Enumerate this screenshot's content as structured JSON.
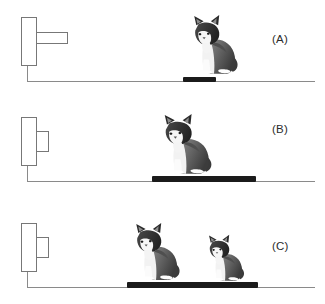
{
  "figure": {
    "background_color": "#ffffff",
    "line_color": "#8a8a8a",
    "outline_color": "#777777",
    "platform_color": "#1b1b1b",
    "label_color": "#2b2b2b"
  },
  "panels": [
    {
      "id": "A",
      "label": "(A)",
      "mechanism": {
        "wall_block": {
          "x": 21,
          "y": 17,
          "width": 16,
          "height": 49
        },
        "rod": {
          "x": 36,
          "y": 32,
          "width": 32,
          "height": 12
        },
        "rod_description": "long extended rod"
      },
      "ground": {
        "x": 27,
        "y": 81,
        "width": 288
      },
      "ground_riser": {
        "x": 27,
        "y": 66,
        "height": 16
      },
      "platform": {
        "x": 183,
        "y": 77,
        "width": 33,
        "height": 5
      },
      "cats": [
        {
          "x": 188,
          "y": 14,
          "width": 52,
          "height": 64,
          "size": "large",
          "facing": "left"
        }
      ],
      "label_pos": {
        "x": 272,
        "y": 33
      }
    },
    {
      "id": "B",
      "label": "(B)",
      "mechanism": {
        "wall_block": {
          "x": 21,
          "y": 117,
          "width": 16,
          "height": 49
        },
        "rod": {
          "x": 36,
          "y": 131,
          "width": 13,
          "height": 21
        },
        "rod_description": "short compressed rod"
      },
      "ground": {
        "x": 27,
        "y": 181,
        "width": 288
      },
      "ground_riser": {
        "x": 27,
        "y": 166,
        "height": 16
      },
      "platform": {
        "x": 152,
        "y": 176,
        "width": 104,
        "height": 6
      },
      "cats": [
        {
          "x": 158,
          "y": 113,
          "width": 56,
          "height": 65,
          "size": "large",
          "facing": "left"
        }
      ],
      "label_pos": {
        "x": 272,
        "y": 123
      }
    },
    {
      "id": "C",
      "label": "(C)",
      "mechanism": {
        "wall_block": {
          "x": 21,
          "y": 223,
          "width": 16,
          "height": 49
        },
        "rod": {
          "x": 36,
          "y": 237,
          "width": 13,
          "height": 21
        },
        "rod_description": "short compressed rod"
      },
      "ground": {
        "x": 27,
        "y": 287,
        "width": 288
      },
      "ground_riser": {
        "x": 27,
        "y": 272,
        "height": 16
      },
      "platform": {
        "x": 127,
        "y": 282,
        "width": 131,
        "height": 6
      },
      "cats": [
        {
          "x": 130,
          "y": 222,
          "width": 52,
          "height": 62,
          "size": "large",
          "facing": "left"
        },
        {
          "x": 204,
          "y": 234,
          "width": 42,
          "height": 50,
          "size": "small",
          "facing": "left"
        }
      ],
      "label_pos": {
        "x": 272,
        "y": 240
      }
    }
  ],
  "icons": {
    "cat": "cat-icon",
    "wall_block": "wall-block-icon",
    "rod": "spring-rod-icon",
    "platform": "platform-bar-icon"
  }
}
